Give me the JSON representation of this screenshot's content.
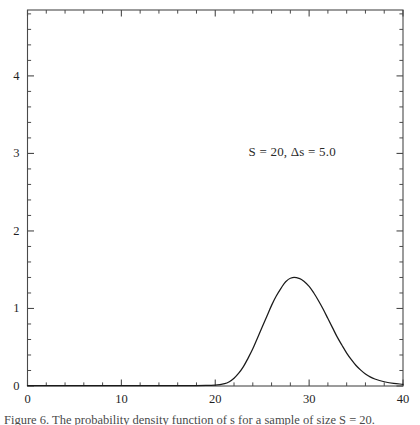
{
  "figure": {
    "background_color": "#ffffff",
    "frame_color": "#4a4a4a",
    "curve_color": "#1a1a1a",
    "annotation": "S = 20, Δs = 5.0",
    "caption": "Figure 6. The probability density function of s for a sample of size S = 20."
  },
  "chart_data": {
    "type": "line",
    "title": "",
    "subtitle": "",
    "xlabel": "",
    "ylabel": "",
    "xlim": [
      0,
      40
    ],
    "ylim": [
      0,
      4.85
    ],
    "grid": false,
    "legend": "none",
    "annotations": [
      {
        "text": "S = 20, Δs = 5.0",
        "x": 28.2,
        "y": 3.02
      }
    ],
    "xticks": [
      0,
      10,
      20,
      30,
      40
    ],
    "xtick_labels": [
      "0",
      "10",
      "20",
      "30",
      "40"
    ],
    "xminor_step": 2,
    "yticks": [
      0,
      1,
      2,
      3,
      4
    ],
    "ytick_labels": [
      "0",
      "1",
      "2",
      "3",
      "4"
    ],
    "yminor_step": 0.2,
    "series": [
      {
        "name": "probability density",
        "peak_x": 28.4,
        "peak_y": 1.4,
        "x": [
          0,
          2,
          4,
          6,
          8,
          10,
          12,
          14,
          16,
          18,
          19,
          20,
          20.5,
          21,
          21.5,
          22,
          22.5,
          23,
          23.5,
          24,
          24.5,
          25,
          25.5,
          26,
          26.5,
          27,
          27.5,
          28,
          28.4,
          29,
          29.5,
          30,
          30.5,
          31,
          31.5,
          32,
          32.5,
          33,
          33.5,
          34,
          34.5,
          35,
          35.5,
          36,
          36.5,
          37,
          38,
          39,
          40
        ],
        "values": [
          0.004,
          0.004,
          0.004,
          0.004,
          0.004,
          0.004,
          0.004,
          0.005,
          0.005,
          0.006,
          0.008,
          0.012,
          0.018,
          0.03,
          0.055,
          0.1,
          0.165,
          0.25,
          0.36,
          0.48,
          0.62,
          0.76,
          0.9,
          1.04,
          1.16,
          1.26,
          1.345,
          1.39,
          1.4,
          1.385,
          1.345,
          1.285,
          1.2,
          1.1,
          0.99,
          0.87,
          0.75,
          0.63,
          0.525,
          0.425,
          0.34,
          0.265,
          0.205,
          0.155,
          0.118,
          0.09,
          0.055,
          0.034,
          0.022
        ]
      }
    ]
  }
}
